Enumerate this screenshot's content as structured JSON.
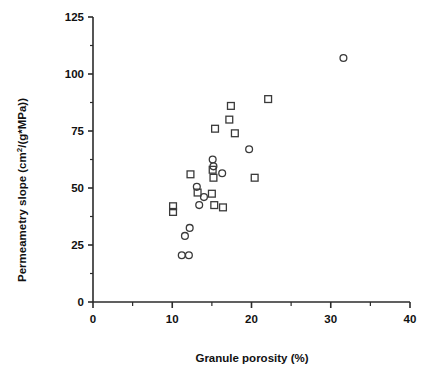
{
  "chart_data": {
    "type": "scatter",
    "title": "",
    "xlabel": "Granule porosity (%)",
    "ylabel_parts": {
      "pre": "Permeametry  slope  (cm",
      "sup": "2",
      "post": "/(g*MPa))"
    },
    "ylabel": "Permeametry slope (cm2/(g*MPa))",
    "xlim": [
      0,
      40
    ],
    "ylim": [
      0,
      125
    ],
    "xticks": [
      0,
      10,
      20,
      30,
      40
    ],
    "xtick_labels": [
      "0",
      "10",
      "20",
      "30",
      "40"
    ],
    "yticks": [
      0,
      25,
      50,
      75,
      100,
      125
    ],
    "ytick_labels": [
      "0",
      "25",
      "50",
      "75",
      "100",
      "125"
    ],
    "x_minor_interval": 5,
    "y_minor_interval": 12.5,
    "grid": false,
    "legend": null,
    "series": [
      {
        "name": "open-circle",
        "marker": "circle",
        "points": [
          {
            "x": 31.6,
            "y": 107.0
          },
          {
            "x": 19.7,
            "y": 67.0
          },
          {
            "x": 15.2,
            "y": 59.5
          },
          {
            "x": 15.1,
            "y": 62.5
          },
          {
            "x": 16.3,
            "y": 56.5
          },
          {
            "x": 13.1,
            "y": 50.5
          },
          {
            "x": 14.0,
            "y": 46.0
          },
          {
            "x": 13.4,
            "y": 42.5
          },
          {
            "x": 12.2,
            "y": 32.5
          },
          {
            "x": 11.6,
            "y": 29.0
          },
          {
            "x": 11.2,
            "y": 20.5
          },
          {
            "x": 12.1,
            "y": 20.5
          }
        ]
      },
      {
        "name": "open-square",
        "marker": "square",
        "points": [
          {
            "x": 22.1,
            "y": 89.0
          },
          {
            "x": 17.4,
            "y": 86.0
          },
          {
            "x": 17.2,
            "y": 80.0
          },
          {
            "x": 15.4,
            "y": 76.0
          },
          {
            "x": 17.9,
            "y": 74.0
          },
          {
            "x": 20.4,
            "y": 54.5
          },
          {
            "x": 15.1,
            "y": 58.0
          },
          {
            "x": 15.2,
            "y": 54.5
          },
          {
            "x": 12.3,
            "y": 56.0
          },
          {
            "x": 13.2,
            "y": 48.0
          },
          {
            "x": 15.0,
            "y": 47.5
          },
          {
            "x": 15.3,
            "y": 42.5
          },
          {
            "x": 16.4,
            "y": 41.5
          },
          {
            "x": 10.1,
            "y": 42.0
          },
          {
            "x": 10.1,
            "y": 39.5
          }
        ]
      }
    ]
  },
  "axes": {
    "x_axis_name": "x-axis",
    "y_axis_name": "y-axis"
  }
}
